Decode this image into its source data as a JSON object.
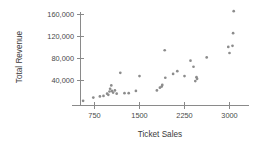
{
  "chart_data": {
    "type": "scatter",
    "title": "",
    "xlabel": "Ticket Sales",
    "ylabel": "Total Revenue",
    "xlim": [
      480,
      3180
    ],
    "ylim": [
      0,
      178000
    ],
    "grid": false,
    "legend": null,
    "xticks": [
      750,
      1500,
      2250,
      3000
    ],
    "xtick_labels": [
      "750",
      "1500",
      "2250",
      "3000"
    ],
    "yticks": [
      40000,
      80000,
      120000,
      160000
    ],
    "ytick_labels": [
      "40,000",
      "80,000",
      "120,000",
      "160,000"
    ],
    "marker": "circle",
    "marker_color": "#8c8c8c",
    "points": [
      {
        "x": 560,
        "y": 3000
      },
      {
        "x": 730,
        "y": 9000
      },
      {
        "x": 840,
        "y": 11000
      },
      {
        "x": 900,
        "y": 12000
      },
      {
        "x": 960,
        "y": 16000
      },
      {
        "x": 980,
        "y": 14000
      },
      {
        "x": 1000,
        "y": 20000
      },
      {
        "x": 1010,
        "y": 25000
      },
      {
        "x": 1030,
        "y": 31000
      },
      {
        "x": 1040,
        "y": 21000
      },
      {
        "x": 1060,
        "y": 18000
      },
      {
        "x": 1090,
        "y": 22000
      },
      {
        "x": 1120,
        "y": 16000
      },
      {
        "x": 1180,
        "y": 54000
      },
      {
        "x": 1250,
        "y": 17000
      },
      {
        "x": 1320,
        "y": 17000
      },
      {
        "x": 1440,
        "y": 21000
      },
      {
        "x": 1500,
        "y": 48000
      },
      {
        "x": 1790,
        "y": 22000
      },
      {
        "x": 1840,
        "y": 27000
      },
      {
        "x": 1870,
        "y": 29000
      },
      {
        "x": 1880,
        "y": 32000
      },
      {
        "x": 1920,
        "y": 95000
      },
      {
        "x": 1930,
        "y": 45000
      },
      {
        "x": 2060,
        "y": 52000
      },
      {
        "x": 2130,
        "y": 57000
      },
      {
        "x": 2250,
        "y": 48000
      },
      {
        "x": 2350,
        "y": 76000
      },
      {
        "x": 2400,
        "y": 65000
      },
      {
        "x": 2430,
        "y": 39000
      },
      {
        "x": 2450,
        "y": 46000
      },
      {
        "x": 2460,
        "y": 43000
      },
      {
        "x": 2620,
        "y": 82000
      },
      {
        "x": 2980,
        "y": 101000
      },
      {
        "x": 3000,
        "y": 90000
      },
      {
        "x": 3050,
        "y": 103000
      },
      {
        "x": 3060,
        "y": 126000
      },
      {
        "x": 3070,
        "y": 166000
      }
    ]
  }
}
